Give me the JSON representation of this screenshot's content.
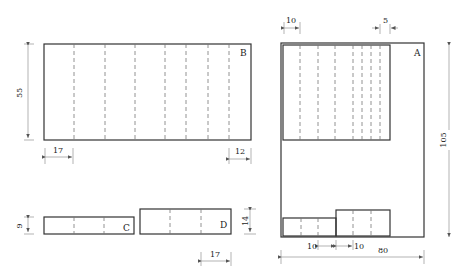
{
  "diagram": {
    "type": "folding/packaging layout",
    "pieces": {
      "A": {
        "label": "A",
        "width_dim": "80",
        "height_dim": "105",
        "top_left_dim": "10",
        "top_right_dim": "5",
        "bottom_dims": [
          "10",
          "10"
        ]
      },
      "B": {
        "label": "B",
        "height_dim": "55",
        "left_dim": "17",
        "right_dim": "12"
      },
      "C": {
        "label": "C",
        "height_dim": "9"
      },
      "D": {
        "label": "D",
        "height_dim": "14",
        "width_dim": "17"
      }
    }
  }
}
